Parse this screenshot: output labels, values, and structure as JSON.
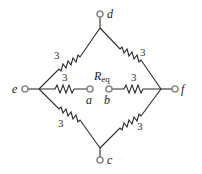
{
  "diagram": {
    "type": "resistor-bridge-circuit",
    "units_shown": false,
    "nodes": {
      "d": {
        "label": "d"
      },
      "e": {
        "label": "e"
      },
      "f": {
        "label": "f"
      },
      "c": {
        "label": "c"
      },
      "a": {
        "label": "a"
      },
      "b": {
        "label": "b"
      }
    },
    "resistors": [
      {
        "id": "R_ed",
        "from": "e",
        "to": "d",
        "value": "3"
      },
      {
        "id": "R_df",
        "from": "d",
        "to": "f",
        "value": "3"
      },
      {
        "id": "R_ea",
        "from": "e",
        "to": "a",
        "value": "3"
      },
      {
        "id": "R_bf",
        "from": "b",
        "to": "f",
        "value": "3"
      },
      {
        "id": "R_ec",
        "from": "e",
        "to": "c",
        "value": "3"
      },
      {
        "id": "R_cf",
        "from": "c",
        "to": "f",
        "value": "3"
      }
    ],
    "req_label": {
      "main": "R",
      "sub": "eq"
    },
    "colors": {
      "wire": "#2a2a2a",
      "terminal": "#8a8a8a",
      "text": "#222222"
    }
  }
}
